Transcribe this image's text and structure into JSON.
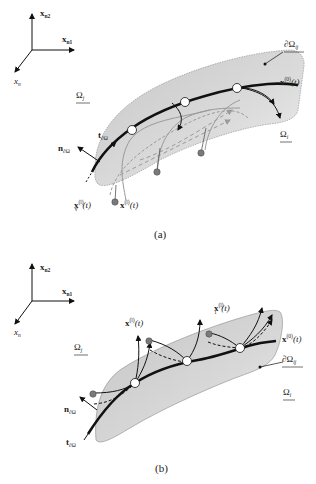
{
  "figure": {
    "panel_a": {
      "caption": "(a)",
      "axes": {
        "x_n2": "x",
        "x_n2_sub": "n2",
        "x_n1": "x",
        "x_n1_sub": "n1",
        "x_n": "x",
        "x_n_sub": "n"
      },
      "labels": {
        "omega_j": "Ω",
        "omega_j_sub": "j",
        "omega_i": "Ω",
        "omega_i_sub": "i",
        "boundary": "∂Ω",
        "boundary_sub": "ij",
        "x0": "x",
        "x0_sup": "(0)",
        "x0_arg": "(t)",
        "xl": "x",
        "xl_sup": "(l)",
        "xl_arg": "(t)",
        "xlv": "x",
        "xlv_sup": "(l)",
        "xlv_sub": "v",
        "xlv_arg": "(t)",
        "t_boundary": "t",
        "t_boundary_sub": "∂Ω",
        "n_boundary": "n",
        "n_boundary_sub": "∂Ω"
      }
    },
    "panel_b": {
      "caption": "(b)",
      "axes": {
        "x_n2": "x",
        "x_n2_sub": "n2",
        "x_n1": "x",
        "x_n1_sub": "n1",
        "x_n": "x",
        "x_n_sub": "n"
      },
      "labels": {
        "omega_j": "Ω",
        "omega_j_sub": "j",
        "omega_i": "Ω",
        "omega_i_sub": "i",
        "boundary": "∂Ω",
        "boundary_sub": "ij",
        "x0": "x",
        "x0_sup": "(0)",
        "x0_arg": "(t)",
        "xl": "x",
        "xl_sup": "(l)",
        "xl_arg": "(t)",
        "xli": "x",
        "xli_sup": "(l)",
        "xli_sub": "i",
        "xli_arg": "(t)",
        "t_boundary": "t",
        "t_boundary_sub": "∂Ω",
        "n_boundary": "n",
        "n_boundary_sub": "∂Ω"
      }
    },
    "colors": {
      "surface_fill": "#d4d4d4",
      "curve": "#111111",
      "node_fill": "#ffffff",
      "dot_fill": "#7a7a7a",
      "gray_path": "#9a9a9a"
    }
  }
}
